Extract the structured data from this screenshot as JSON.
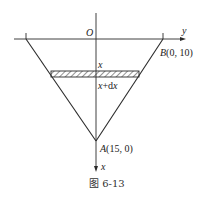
{
  "figure": {
    "caption": "图 6-13",
    "labels": {
      "origin": "O",
      "y_axis": "y",
      "x_axis": "x",
      "point_b": "B(0, 10)",
      "point_a": "A(15, 0)",
      "strip_top": "x",
      "strip_bottom": "x+dx"
    },
    "colors": {
      "line": "#2a2a2a",
      "hatch": "#2a2a2a"
    }
  }
}
